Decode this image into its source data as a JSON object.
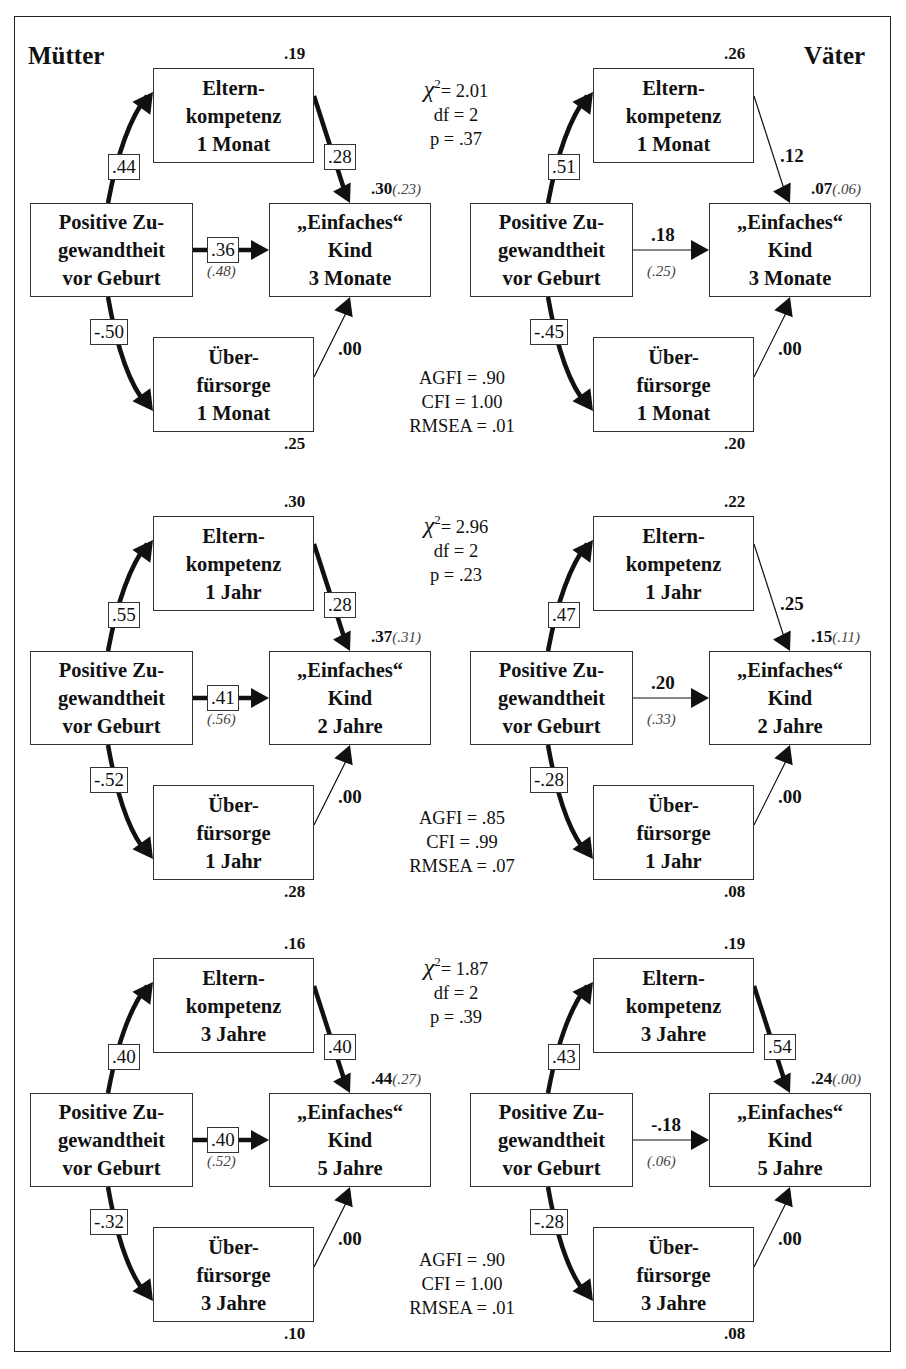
{
  "figure": {
    "group_labels": {
      "left": "Mütter",
      "right": "Väter"
    },
    "node_labels": {
      "predictor": [
        "Positive Zu-",
        "gewandtheit",
        "vor Geburt"
      ],
      "mediator1_line1": "Eltern-",
      "mediator1_line2": "kompetenz",
      "mediator2_line1": "Über-",
      "mediator2_line2": "fürsorge",
      "outcome_line1": "„Einfaches“",
      "outcome_line2": "Kind"
    },
    "panels": [
      {
        "mediator_time": "1 Monat",
        "outcome_time": "3 Monate",
        "stats_top": {
          "chi_label": "χ",
          "chi_sup": "2",
          "chi_value": "= 2.01",
          "df": "df = 2",
          "p": "p = .37"
        },
        "stats_bottom": {
          "agfi": "AGFI = .90",
          "cfi": "CFI = 1.00",
          "rmsea": "RMSEA = .01"
        },
        "left": {
          "r2_mediator1": ".19",
          "r2_mediator2": ".25",
          "r2_outcome": ".30",
          "r2_outcome_alt": "(.23)",
          "path_pred_med1": ".44",
          "path_med1_out": ".28",
          "path_pred_out": ".36",
          "path_pred_out_alt": "(.48)",
          "path_pred_med2": "-.50",
          "path_med2_out": ".00",
          "med1_out_boxed": true,
          "pred_out_boxed": true
        },
        "right": {
          "r2_mediator1": ".26",
          "r2_mediator2": ".20",
          "r2_outcome": ".07",
          "r2_outcome_alt": "(.06)",
          "path_pred_med1": ".51",
          "path_med1_out": ".12",
          "path_pred_out": ".18",
          "path_pred_out_alt": "(.25)",
          "path_pred_med2": "-.45",
          "path_med2_out": ".00",
          "med1_out_boxed": false,
          "pred_out_boxed": false
        }
      },
      {
        "mediator_time": "1 Jahr",
        "outcome_time": "2 Jahre",
        "stats_top": {
          "chi_label": "χ",
          "chi_sup": "2",
          "chi_value": "= 2.96",
          "df": "df = 2",
          "p": "p = .23"
        },
        "stats_bottom": {
          "agfi": "AGFI = .85",
          "cfi": "CFI = .99",
          "rmsea": "RMSEA = .07"
        },
        "left": {
          "r2_mediator1": ".30",
          "r2_mediator2": ".28",
          "r2_outcome": ".37",
          "r2_outcome_alt": "(.31)",
          "path_pred_med1": ".55",
          "path_med1_out": ".28",
          "path_pred_out": ".41",
          "path_pred_out_alt": "(.56)",
          "path_pred_med2": "-.52",
          "path_med2_out": ".00",
          "med1_out_boxed": true,
          "pred_out_boxed": true
        },
        "right": {
          "r2_mediator1": ".22",
          "r2_mediator2": ".08",
          "r2_outcome": ".15",
          "r2_outcome_alt": "(.11)",
          "path_pred_med1": ".47",
          "path_med1_out": ".25",
          "path_pred_out": ".20",
          "path_pred_out_alt": "(.33)",
          "path_pred_med2": "-.28",
          "path_med2_out": ".00",
          "med1_out_boxed": false,
          "pred_out_boxed": false
        }
      },
      {
        "mediator_time": "3 Jahre",
        "outcome_time": "5 Jahre",
        "stats_top": {
          "chi_label": "χ",
          "chi_sup": "2",
          "chi_value": "= 1.87",
          "df": "df = 2",
          "p": "p = .39"
        },
        "stats_bottom": {
          "agfi": "AGFI = .90",
          "cfi": "CFI = 1.00",
          "rmsea": "RMSEA = .01"
        },
        "left": {
          "r2_mediator1": ".16",
          "r2_mediator2": ".10",
          "r2_outcome": ".44",
          "r2_outcome_alt": "(.27)",
          "path_pred_med1": ".40",
          "path_med1_out": ".40",
          "path_pred_out": ".40",
          "path_pred_out_alt": "(.52)",
          "path_pred_med2": "-.32",
          "path_med2_out": ".00",
          "med1_out_boxed": true,
          "pred_out_boxed": true
        },
        "right": {
          "r2_mediator1": ".19",
          "r2_mediator2": ".08",
          "r2_outcome": ".24",
          "r2_outcome_alt": "(.00)",
          "path_pred_med1": ".43",
          "path_med1_out": ".54",
          "path_pred_out": "-.18",
          "path_pred_out_alt": "(.06)",
          "path_pred_med2": "-.28",
          "path_med2_out": ".00",
          "med1_out_boxed": true,
          "pred_out_boxed": false
        }
      }
    ]
  }
}
